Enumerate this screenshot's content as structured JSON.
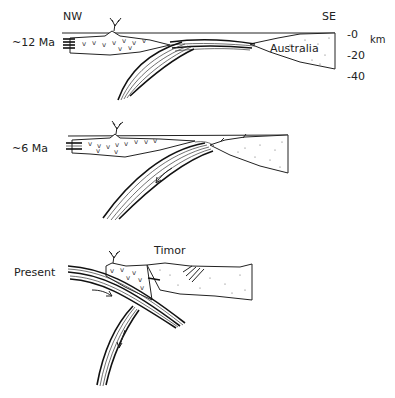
{
  "figure": {
    "type": "geological cross-section diagram",
    "orientation": {
      "left": "NW",
      "right": "SE"
    },
    "depth_scale": {
      "unit": "km",
      "ticks": [
        "-0",
        "-20",
        "-40"
      ]
    },
    "panels": [
      {
        "id": "p12",
        "label": "~12 Ma",
        "annotations": [
          "Australia"
        ]
      },
      {
        "id": "p6",
        "label": "~6 Ma",
        "annotations": []
      },
      {
        "id": "pp",
        "label": "Present",
        "annotations": [
          "Timor"
        ]
      }
    ],
    "colors": {
      "ink": "#222222",
      "background": "#ffffff",
      "stipple": "#666666"
    }
  }
}
